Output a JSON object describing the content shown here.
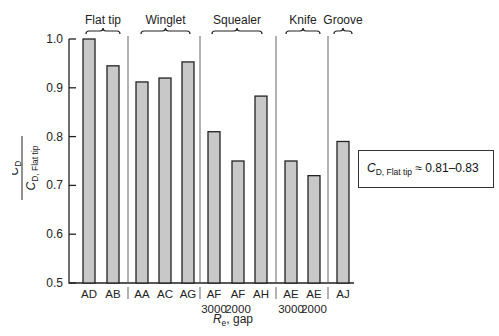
{
  "chart_data": {
    "type": "bar",
    "title": "",
    "xlabel": "R_e, gap",
    "xlabel_main": "R",
    "xlabel_sub": "e",
    "xlabel_rest": ", gap",
    "ylabel": "C_D / C_D, Flat tip",
    "ylabel_num": "C",
    "ylabel_num_sub": "D",
    "ylabel_den": "C",
    "ylabel_den_sub": "D, Flat tip",
    "ylim": [
      0.5,
      1.0
    ],
    "yticks": [
      "0.5",
      "0.6",
      "0.7",
      "0.8",
      "0.9",
      "1.0"
    ],
    "grid": false,
    "categories": [
      "AD",
      "AB",
      "AA",
      "AC",
      "AG",
      "AF 3000",
      "AF 2000",
      "AH",
      "AE 3000",
      "AE 2000",
      "AJ"
    ],
    "category_line1": [
      "AD",
      "AB",
      "AA",
      "AC",
      "AG",
      "AF",
      "AF",
      "AH",
      "AE",
      "AE",
      "AJ"
    ],
    "category_line2": [
      "",
      "",
      "",
      "",
      "",
      "3000",
      "2000",
      "",
      "3000",
      "2000",
      ""
    ],
    "values": [
      1.0,
      0.945,
      0.912,
      0.92,
      0.953,
      0.81,
      0.75,
      0.883,
      0.75,
      0.72,
      0.79
    ],
    "groups": [
      {
        "name": "Flat tip",
        "members": [
          "AD",
          "AB"
        ]
      },
      {
        "name": "Winglet",
        "members": [
          "AA",
          "AC",
          "AG"
        ]
      },
      {
        "name": "Squealer",
        "members": [
          "AF 3000",
          "AF 2000",
          "AH"
        ]
      },
      {
        "name": "Knife",
        "members": [
          "AE 3000",
          "AE 2000"
        ]
      },
      {
        "name": "Groove",
        "members": [
          "AJ"
        ]
      }
    ],
    "annotation": "C_D, Flat tip ≈ 0.81–0.83",
    "bar_color": "#c8c8c8"
  },
  "note": {
    "c": "C",
    "sub": "D, Flat tip",
    "rest": " ≈ 0.81–0.83"
  }
}
